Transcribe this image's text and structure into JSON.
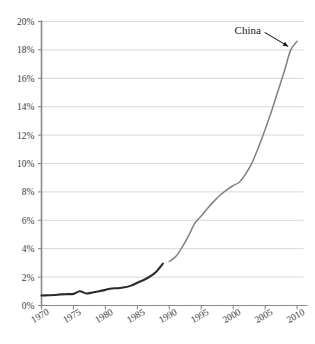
{
  "chart_data": {
    "type": "line",
    "title": "",
    "subtitle": "",
    "xlabel": "",
    "ylabel": "",
    "xlim": [
      1970,
      2011
    ],
    "ylim": [
      0,
      20
    ],
    "grid": true,
    "grid_axis": "y",
    "legend": "none",
    "y_tick_labels": [
      "0%",
      "2%",
      "4%",
      "6%",
      "8%",
      "10%",
      "12%",
      "14%",
      "16%",
      "18%",
      "20%"
    ],
    "y_tick_values": [
      0,
      2,
      4,
      6,
      8,
      10,
      12,
      14,
      16,
      18,
      20
    ],
    "x_tick_labels": [
      "1970",
      "1975",
      "1980",
      "1985",
      "1990",
      "1995",
      "2000",
      "2005",
      "2010"
    ],
    "x_tick_values": [
      1970,
      1975,
      1980,
      1985,
      1990,
      1995,
      2000,
      2005,
      2010
    ],
    "annotations": [
      {
        "text": "China",
        "x": 2009,
        "y": 18.0,
        "arrow": true,
        "arrow_direction": "down-right"
      }
    ],
    "series": [
      {
        "name": "China (early period)",
        "color": "#2b2b2b",
        "width": 2.1,
        "x": [
          1970,
          1971,
          1972,
          1973,
          1974,
          1975,
          1976,
          1977,
          1978,
          1979,
          1980,
          1981,
          1982,
          1983,
          1984,
          1985,
          1986,
          1987,
          1988,
          1989
        ],
        "values": [
          0.7,
          0.72,
          0.74,
          0.78,
          0.8,
          0.82,
          1.0,
          0.85,
          0.92,
          1.0,
          1.1,
          1.2,
          1.22,
          1.28,
          1.4,
          1.6,
          1.8,
          2.05,
          2.4,
          2.95
        ]
      },
      {
        "name": "China (later period)",
        "color": "#808080",
        "width": 1.5,
        "x": [
          1990,
          1991,
          1992,
          1993,
          1994,
          1995,
          1996,
          1997,
          1998,
          1999,
          2000,
          2001,
          2002,
          2003,
          2004,
          2005,
          2006,
          2007,
          2008,
          2009,
          2010
        ],
        "values": [
          3.1,
          3.45,
          4.1,
          4.9,
          5.8,
          6.3,
          6.85,
          7.35,
          7.8,
          8.15,
          8.45,
          8.7,
          9.3,
          10.1,
          11.2,
          12.4,
          13.7,
          15.1,
          16.5,
          18.0,
          18.6
        ]
      }
    ]
  },
  "style": {
    "axis_color": "#8a8a8a",
    "grid_color": "#d8d8d8",
    "tick_label_color": "#3a3a3a",
    "annotation_color": "#1a1a1a",
    "background": "#ffffff"
  }
}
